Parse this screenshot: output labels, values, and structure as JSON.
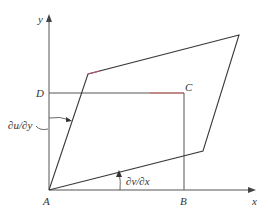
{
  "diagram": {
    "axes": {
      "x_label": "x",
      "y_label": "y"
    },
    "points": {
      "A": "A",
      "B": "B",
      "C": "C",
      "D": "D"
    },
    "annotations": {
      "shear_y": "∂u/∂y",
      "shear_x": "∂v/∂x"
    },
    "colors": {
      "line": "#3a3a3a",
      "rect_top_edge": "#d46a6a",
      "deformed_edge_accent": "#c05080"
    }
  }
}
